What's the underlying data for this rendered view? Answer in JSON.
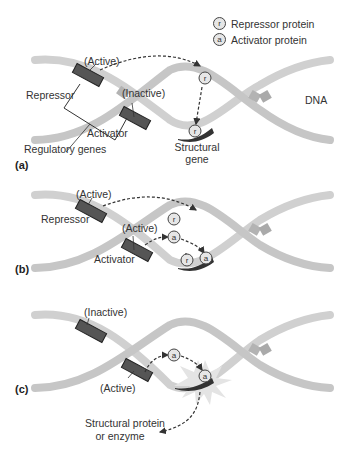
{
  "legend": {
    "items": [
      {
        "symbol": "r",
        "label": "Repressor protein"
      },
      {
        "symbol": "a",
        "label": "Activator protein"
      }
    ]
  },
  "panels": [
    {
      "id": "a",
      "label": "(a)",
      "repressor_state": "(Active)",
      "activator_state": "(Inactive)",
      "repressor_label": "Repressor",
      "activator_label": "Activator",
      "regulatory_label": "Regulatory genes",
      "structural_label_line1": "Structural",
      "structural_label_line2": "gene",
      "dna_label": "DNA",
      "proteins": [
        "r",
        "r"
      ]
    },
    {
      "id": "b",
      "label": "(b)",
      "repressor_state": "(Active)",
      "activator_state": "(Active)",
      "repressor_label": "Repressor",
      "activator_label": "Activator",
      "proteins": [
        "r",
        "a",
        "r",
        "a"
      ]
    },
    {
      "id": "c",
      "label": "(c)",
      "repressor_state": "(Inactive)",
      "activator_state": "(Active)",
      "product_label_line1": "Structural protein",
      "product_label_line2": "or enzyme",
      "proteins": [
        "a",
        "a"
      ]
    }
  ],
  "colors": {
    "dna_strand": "#cfcfcf",
    "dna_band": "#b5b5b5",
    "gene_block": "#555555",
    "structural_gene": "#333333",
    "protein_fill": "#e6e6e6",
    "burst": "#e0e0e0",
    "arrow": "#333333"
  }
}
